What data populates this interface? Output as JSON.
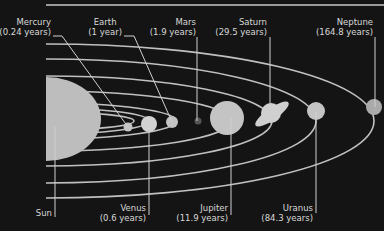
{
  "diagram": {
    "type": "solar-system-orbital-periods",
    "colors": {
      "background": "#141414",
      "orbit": "#c8c8c8",
      "planet": "#bdbdbd",
      "text": "#d8d8d8"
    }
  },
  "bodies": [
    {
      "name": "Sun",
      "period": ""
    },
    {
      "name": "Mercury",
      "period": "(0.24 years)"
    },
    {
      "name": "Venus",
      "period": "(0.6 years)"
    },
    {
      "name": "Earth",
      "period": "(1 year)"
    },
    {
      "name": "Mars",
      "period": "(1.9 years)"
    },
    {
      "name": "Jupiter",
      "period": "(11.9 years)"
    },
    {
      "name": "Saturn",
      "period": "(29.5 years)"
    },
    {
      "name": "Uranus",
      "period": "(84.3 years)"
    },
    {
      "name": "Neptune",
      "period": "(164.8 years)"
    }
  ]
}
